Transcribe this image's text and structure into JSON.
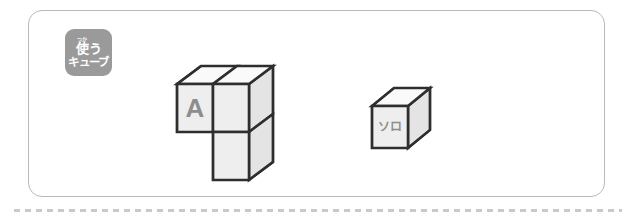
{
  "panel": {
    "badge": {
      "furigana": "つか",
      "kanji": "使",
      "kanji_tail": "う",
      "line2": "キューブ",
      "full_text": "使うキューブ",
      "background_color": "#9a9a9a",
      "text_color": "#ffffff"
    },
    "border_color": "#b9b9b9",
    "background_color": "#ffffff"
  },
  "figures": [
    {
      "name": "shape-a",
      "label": "A",
      "cube_count": 3,
      "description": "L-shaped tricube: two cubes in the top row, one cube beneath the right-hand cube",
      "label_face": "front-left",
      "label_color": "#8d8d8d"
    },
    {
      "name": "shape-solo",
      "label": "ソロ",
      "cube_count": 1,
      "description": "single unit cube",
      "label_face": "front",
      "label_color": "#8d8d8d"
    }
  ],
  "style": {
    "edge_color": "#2e2e2e",
    "top_face_color": "#fafafa",
    "front_face_color": "#eeeeee",
    "side_face_color": "#e4e4e4",
    "dotted_rule_color": "#c9c9c9"
  }
}
